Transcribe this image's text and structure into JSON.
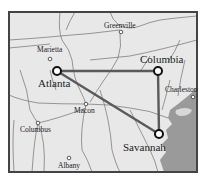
{
  "map": {
    "colors": {
      "land": "#e8e8e8",
      "water": "#9a9a9a",
      "frame": "#444444",
      "route": "#5a5a5a",
      "roads": "#707070"
    },
    "route_cities": [
      {
        "name": "Atlanta",
        "x": 57,
        "y": 71
      },
      {
        "name": "Columbia",
        "x": 158,
        "y": 71
      },
      {
        "name": "Savannah",
        "x": 159,
        "y": 134
      }
    ],
    "minor_cities": [
      {
        "name": "Greenville",
        "x": 121,
        "y": 32
      },
      {
        "name": "Marietta",
        "x": 50,
        "y": 59
      },
      {
        "name": "Macon",
        "x": 86,
        "y": 104
      },
      {
        "name": "Columbus",
        "x": 38,
        "y": 123
      },
      {
        "name": "Albany",
        "x": 69,
        "y": 158
      },
      {
        "name": "Charleston",
        "x": 193,
        "y": 97
      }
    ],
    "labels": {
      "atlanta": "Atlanta",
      "columbia": "Columbia",
      "savannah": "Savannah",
      "greenville": "Greenville",
      "marietta": "Marietta",
      "macon": "Macon",
      "columbus": "Columbus",
      "albany": "Albany",
      "charleston": "Charleston"
    }
  }
}
